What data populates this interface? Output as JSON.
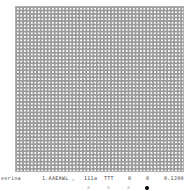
{
  "grid": {
    "columns": 48,
    "rows": 47,
    "cell_color": "#9a9a9a",
    "dot_color": "#ffffff"
  },
  "status": {
    "fields": [
      "enrina",
      "1.AAEAWL ,",
      "111a",
      "TTT",
      "0",
      "0",
      "0.1200"
    ]
  },
  "pager": {
    "dots": [
      {
        "active": false
      },
      {
        "active": false
      },
      {
        "active": false
      },
      {
        "active": true
      }
    ],
    "active_color": "#000000",
    "inactive_color": "#d8d8d8"
  }
}
